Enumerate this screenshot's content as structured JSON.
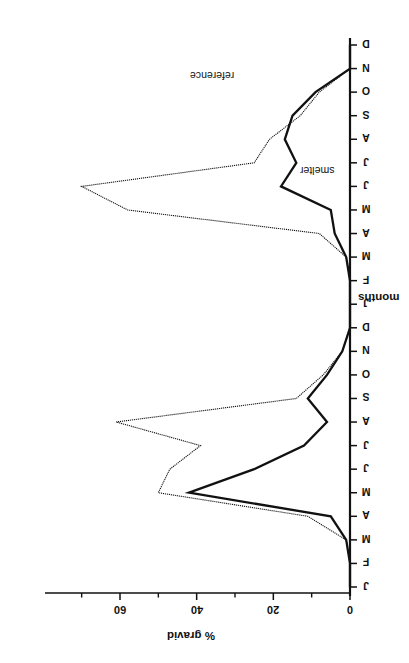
{
  "figure": {
    "rotation_deg": 90,
    "background": "#ffffff",
    "ink_color": "#111111"
  },
  "chart_data": {
    "type": "line",
    "title": "",
    "xlabel": "months",
    "ylabel": "% gravid",
    "orientation": "rotated-90-clockwise",
    "grid": false,
    "legend": "inline-annotations",
    "xlim": [
      0,
      23
    ],
    "ylim": [
      0,
      72
    ],
    "yticks": [
      0,
      20,
      40,
      60
    ],
    "ytick_labels": [
      "0",
      "20",
      "40",
      "60"
    ],
    "minor_yticks": [
      10,
      30,
      50,
      70
    ],
    "categories": [
      "J",
      "F",
      "M",
      "A",
      "M",
      "J",
      "J",
      "A",
      "S",
      "O",
      "N",
      "D",
      "J",
      "F",
      "M",
      "A",
      "M",
      "J",
      "J",
      "A",
      "S",
      "O",
      "N",
      "D"
    ],
    "series": [
      {
        "name": "reference",
        "style": "thin-dotted",
        "linewidth": 1,
        "values": [
          0,
          0,
          1,
          11,
          50,
          47,
          39,
          61,
          14,
          7,
          2,
          0,
          0,
          0,
          1,
          8,
          58,
          70,
          25,
          21,
          13,
          8,
          0,
          0
        ]
      },
      {
        "name": "smelter",
        "style": "thick-solid",
        "linewidth": 2,
        "values": [
          0,
          0,
          1,
          5,
          42,
          25,
          12,
          6,
          11,
          6,
          2,
          0,
          0,
          0,
          1,
          4,
          5,
          18,
          14,
          17,
          15,
          9,
          0,
          0
        ]
      }
    ],
    "annotations": [
      {
        "text": "reference",
        "series": "reference"
      },
      {
        "text": "smelter",
        "series": "smelter"
      }
    ]
  },
  "axes": {
    "month_axis": {
      "label": "months",
      "tick_labels": [
        "J",
        "F",
        "M",
        "A",
        "M",
        "J",
        "J",
        "A",
        "S",
        "O",
        "N",
        "D",
        "J",
        "F",
        "M",
        "A",
        "M",
        "J",
        "J",
        "A",
        "S",
        "O",
        "N",
        "D"
      ]
    },
    "value_axis": {
      "label": "% gravid",
      "tick_labels": [
        "0",
        "20",
        "40",
        "60"
      ]
    }
  },
  "series_labels": {
    "reference": "reference",
    "smelter": "smelter"
  }
}
